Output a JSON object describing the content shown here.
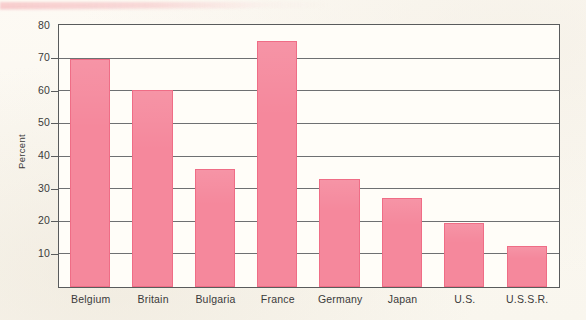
{
  "chart_data": {
    "type": "bar",
    "title": "",
    "subtitle": "",
    "xlabel": "",
    "ylabel": "Percent",
    "ylim": [
      0,
      80
    ],
    "ytick_values": [
      10,
      20,
      30,
      40,
      50,
      60,
      70,
      80
    ],
    "ytick_labels": [
      "10",
      "20",
      "30",
      "40",
      "50",
      "60",
      "70",
      "80"
    ],
    "grid": "horizontal",
    "legend": "none",
    "categories": [
      "Belgium",
      "Britain",
      "Bulgaria",
      "France",
      "Germany",
      "Japan",
      "U.S.",
      "U.S.S.R."
    ],
    "values": [
      70.0,
      60.3,
      36.3,
      75.5,
      33.2,
      27.4,
      19.5,
      12.7
    ],
    "series": [
      {
        "name": "Percent",
        "values": [
          70.0,
          60.3,
          36.3,
          75.5,
          33.2,
          27.4,
          19.5,
          12.7
        ]
      }
    ],
    "bar_fill_color": "#f5889c",
    "bar_edge_color": "#ef6d86",
    "axis_color": "#595b5c",
    "gridline_color": "#6e7072",
    "plot_background": "#fffdf8",
    "page_background": "#faf7f0"
  }
}
